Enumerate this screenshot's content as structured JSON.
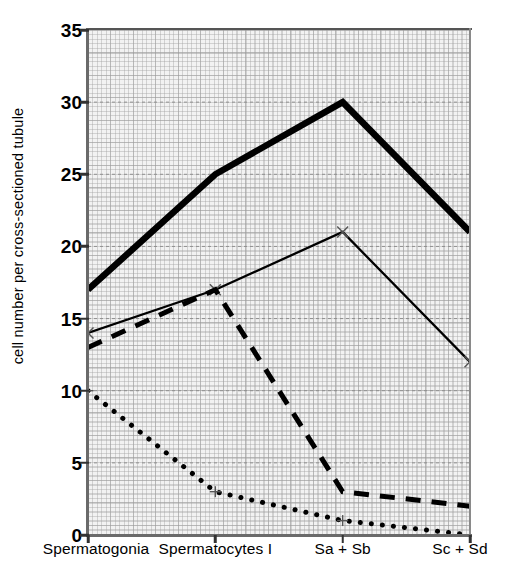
{
  "chart_data": {
    "type": "line",
    "title": "",
    "xlabel": "",
    "ylabel": "cell number per cross-sectioned tubule",
    "categories": [
      "Spermatogonia",
      "Spermatocytes I",
      "Sa + Sb",
      "Sc + Sd"
    ],
    "ylim": [
      0,
      35
    ],
    "yticks": [
      0,
      5,
      10,
      15,
      20,
      25,
      30,
      35
    ],
    "ytick_labels": [
      "0",
      "5",
      "10",
      "15",
      "20",
      "25",
      "30",
      "35"
    ],
    "grid": true,
    "legend": "none",
    "series": [
      {
        "name": "thick-solid",
        "style": "solid-thick",
        "marker": "none",
        "color": "#000000",
        "values": [
          17,
          25,
          30,
          21
        ]
      },
      {
        "name": "thin-solid",
        "style": "solid-thin",
        "marker": "x",
        "color": "#000000",
        "values": [
          14,
          17,
          21,
          12
        ]
      },
      {
        "name": "dashed",
        "style": "dashed",
        "marker": "none",
        "color": "#000000",
        "values": [
          13,
          17,
          3,
          2
        ]
      },
      {
        "name": "dotted",
        "style": "dotted",
        "marker": "plus",
        "color": "#000000",
        "values": [
          10,
          3,
          1,
          0
        ]
      }
    ]
  },
  "axis": {
    "y_label": "cell number per cross-sectioned tubule"
  },
  "caption": {
    "text": ""
  }
}
